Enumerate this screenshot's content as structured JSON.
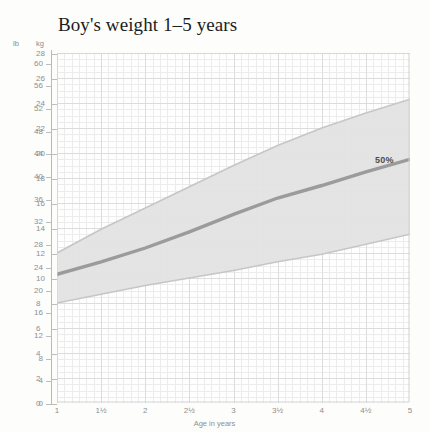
{
  "title": "Boy's weight 1–5 years",
  "units": {
    "left": "lb",
    "right": "kg"
  },
  "annotation": {
    "percentile": "50%"
  },
  "chart_data": {
    "type": "area",
    "title": "Boy's weight 1–5 years",
    "xlabel": "Age in years",
    "ylabel": "kg",
    "ylabel_secondary": "lb",
    "xlim": [
      1,
      5
    ],
    "ylim": [
      0,
      28
    ],
    "ylim_lb": [
      0,
      61.7
    ],
    "grid": true,
    "legend": "none",
    "x_ticks": [
      1,
      1.5,
      2,
      2.5,
      3,
      3.5,
      4,
      4.5,
      5
    ],
    "x_ticklabels": [
      "1",
      "1½",
      "2",
      "2½",
      "3",
      "3½",
      "4",
      "4½",
      "5"
    ],
    "y_ticks_kg": [
      0,
      2,
      4,
      6,
      8,
      10,
      12,
      14,
      16,
      18,
      20,
      22,
      24,
      26,
      28
    ],
    "y_ticklabels_kg": [
      "0",
      "2",
      "4",
      "6",
      "8",
      "10",
      "12",
      "14",
      "16",
      "18",
      "20",
      "22",
      "24",
      "26",
      "28"
    ],
    "y_ticks_lb": [
      0,
      4,
      8,
      12,
      16,
      20,
      24,
      28,
      32,
      36,
      40,
      44,
      48,
      52,
      56,
      60
    ],
    "y_ticklabels_lb": [
      "0",
      "4",
      "8",
      "12",
      "16",
      "20",
      "24",
      "28",
      "32",
      "36",
      "40",
      "44",
      "48",
      "52",
      "56",
      "60"
    ],
    "x": [
      1,
      1.5,
      2,
      2.5,
      3,
      3.5,
      4,
      4.5,
      5
    ],
    "series": [
      {
        "name": "upper band (97th percentile)",
        "values": [
          12.0,
          13.9,
          15.6,
          17.3,
          19.0,
          20.6,
          22.0,
          23.2,
          24.3
        ]
      },
      {
        "name": "50%",
        "values": [
          10.3,
          11.3,
          12.4,
          13.7,
          15.1,
          16.4,
          17.4,
          18.5,
          19.5
        ]
      },
      {
        "name": "lower band (3rd percentile)",
        "values": [
          8.0,
          8.7,
          9.4,
          10.0,
          10.6,
          11.3,
          11.9,
          12.7,
          13.5
        ]
      }
    ],
    "colors": {
      "band_fill": "#e2e2e2",
      "band_edge": "#c9c9c9",
      "median_line": "#9a9a9a",
      "grid_minor": "#ececec",
      "grid_major": "#dcdcdc",
      "axis": "#b9b9b9",
      "text": "#8f8f8f",
      "title": "#1c1c1c",
      "background": "#fdfdfc"
    }
  }
}
